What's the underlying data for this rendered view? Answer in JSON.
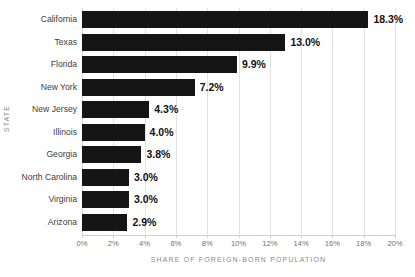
{
  "chart_data": {
    "type": "bar",
    "orientation": "horizontal",
    "title": "",
    "xlabel": "SHARE OF FOREIGN-BORN POPULATION",
    "ylabel": "STATE",
    "xlim": [
      0,
      20
    ],
    "grid": true,
    "legend": false,
    "bar_color": "#151515",
    "gridline_color": "#e2e2e2",
    "categories": [
      "California",
      "Texas",
      "Florida",
      "New York",
      "New Jersey",
      "Illinois",
      "Georgia",
      "North Carolina",
      "Virginia",
      "Arizona"
    ],
    "values": [
      18.3,
      13.0,
      9.9,
      7.2,
      4.3,
      4.0,
      3.8,
      3.0,
      3.0,
      2.9
    ],
    "value_labels": [
      "18.3%",
      "13.0%",
      "9.9%",
      "7.2%",
      "4.3%",
      "4.0%",
      "3.8%",
      "3.0%",
      "3.0%",
      "2.9%"
    ],
    "xticks": [
      0,
      2,
      4,
      6,
      8,
      10,
      12,
      14,
      16,
      18,
      20
    ],
    "xtick_labels": [
      "0%",
      "2%",
      "4%",
      "6%",
      "8%",
      "10%",
      "12%",
      "14%",
      "16%",
      "18%",
      "20%"
    ]
  }
}
